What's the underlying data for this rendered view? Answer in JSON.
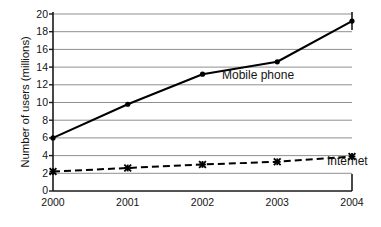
{
  "chart_data": {
    "type": "line",
    "title": "",
    "xlabel": "",
    "ylabel": "Number of users (millions)",
    "x": [
      "2000",
      "2001",
      "2002",
      "2003",
      "2004"
    ],
    "categories": [
      "2000",
      "2001",
      "2002",
      "2003",
      "2004"
    ],
    "xlim": [
      2000,
      2004
    ],
    "ylim": [
      0,
      20
    ],
    "y_ticks": [
      0,
      2,
      4,
      6,
      8,
      10,
      12,
      14,
      16,
      18,
      20
    ],
    "y_tick_labels": [
      "0",
      "2",
      "4",
      "6",
      "8",
      "10",
      "12",
      "14",
      "16",
      "18",
      "20"
    ],
    "grid": "horizontal",
    "legend_position": "inline-annotations",
    "series": [
      {
        "name": "Mobile phone",
        "values": [
          6.0,
          9.8,
          13.2,
          14.6,
          19.2
        ],
        "line_style": "solid",
        "marker": "filled-circle",
        "color": "#000000"
      },
      {
        "name": "Internet",
        "values": [
          2.2,
          2.6,
          3.0,
          3.3,
          3.9
        ],
        "line_style": "dashed",
        "marker": "cross-x",
        "color": "#000000"
      }
    ],
    "annotations": [
      {
        "text": "Mobile phone",
        "series": "Mobile phone"
      },
      {
        "text": "Internet",
        "series": "Internet"
      }
    ]
  },
  "axes": {
    "y_title": "Number of users (millions)",
    "y_tick_labels": [
      "20",
      "18",
      "16",
      "14",
      "12",
      "10",
      "8",
      "6",
      "4",
      "2",
      "0"
    ],
    "x_tick_labels": [
      "2000",
      "2001",
      "2002",
      "2003",
      "2004"
    ]
  },
  "colors": {
    "axis": "#1a1a1a",
    "gridline": "#9a9a9a",
    "series_mobile": "#000000",
    "series_internet": "#000000",
    "background": "#ffffff"
  }
}
